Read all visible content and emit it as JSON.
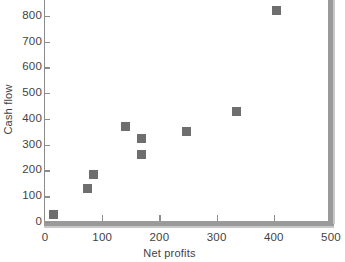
{
  "chart_data": {
    "type": "scatter",
    "title": "",
    "xlabel": "Net profits",
    "ylabel": "Cash flow",
    "xlim": [
      0,
      500
    ],
    "ylim": [
      0,
      900
    ],
    "xticks": [
      0,
      100,
      200,
      300,
      400,
      500
    ],
    "yticks": [
      0,
      100,
      200,
      300,
      400,
      500,
      600,
      700,
      800,
      900
    ],
    "xtick_labels": [
      "0",
      "100",
      "200",
      "300",
      "400",
      "500"
    ],
    "ytick_labels": [
      "0",
      "100",
      "200",
      "300",
      "400",
      "500",
      "600",
      "700",
      "800",
      "900"
    ],
    "grid": false,
    "legend": null,
    "marker": {
      "shape": "square",
      "color": "#6e6e6e",
      "size": 9
    },
    "axis_color": "#8c8c8c",
    "note": "top of figure is cropped; the 900 y-tick label is only partially visible",
    "points": [
      {
        "x": 15,
        "y": 30
      },
      {
        "x": 75,
        "y": 130
      },
      {
        "x": 85,
        "y": 185
      },
      {
        "x": 140,
        "y": 370
      },
      {
        "x": 168,
        "y": 325
      },
      {
        "x": 169,
        "y": 262
      },
      {
        "x": 248,
        "y": 350
      },
      {
        "x": 335,
        "y": 430
      },
      {
        "x": 405,
        "y": 820
      }
    ]
  }
}
